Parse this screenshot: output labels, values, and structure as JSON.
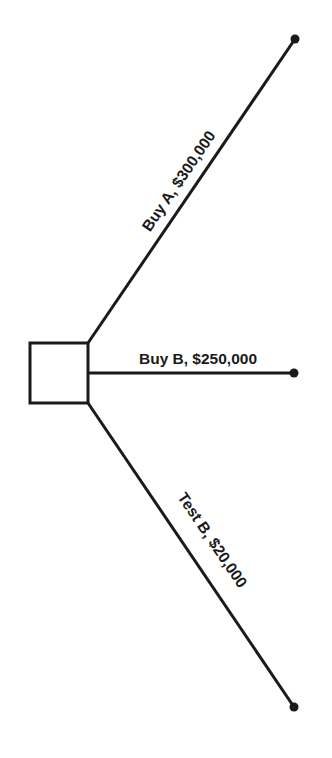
{
  "diagram": {
    "type": "decision-tree",
    "decision_node": {
      "shape": "square"
    },
    "branches": [
      {
        "id": "buy-a",
        "label": "Buy A, $300,000",
        "option": "Buy A",
        "cost": "$300,000"
      },
      {
        "id": "buy-b",
        "label": "Buy B, $250,000",
        "option": "Buy B",
        "cost": "$250,000"
      },
      {
        "id": "test-b",
        "label": "Test B, $20,000",
        "option": "Test B",
        "cost": "$20,000"
      }
    ],
    "colors": {
      "line": "#1a1a1a",
      "background": "#ffffff"
    }
  }
}
